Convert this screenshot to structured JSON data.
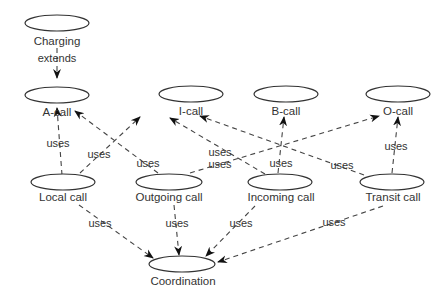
{
  "diagram": {
    "type": "use-case diagram",
    "nodes": [
      {
        "id": "charging",
        "label": "Charging"
      },
      {
        "id": "a_call",
        "label": "A-call"
      },
      {
        "id": "i_call",
        "label": "I-call"
      },
      {
        "id": "b_call",
        "label": "B-call"
      },
      {
        "id": "o_call",
        "label": "O-call"
      },
      {
        "id": "local_call",
        "label": "Local call"
      },
      {
        "id": "outgoing_call",
        "label": "Outgoing call"
      },
      {
        "id": "incoming_call",
        "label": "Incoming call"
      },
      {
        "id": "transit_call",
        "label": "Transit call"
      },
      {
        "id": "coordination",
        "label": "Coordination"
      }
    ],
    "edges": [
      {
        "from": "charging",
        "to": "a_call",
        "label": "extends"
      },
      {
        "from": "local_call",
        "to": "a_call",
        "label": "uses"
      },
      {
        "from": "local_call",
        "to": "i_call",
        "label": "uses"
      },
      {
        "from": "outgoing_call",
        "to": "a_call",
        "label": "uses"
      },
      {
        "from": "outgoing_call",
        "to": "o_call",
        "label": "uses"
      },
      {
        "from": "incoming_call",
        "to": "i_call",
        "label": "uses"
      },
      {
        "from": "incoming_call",
        "to": "b_call",
        "label": "uses"
      },
      {
        "from": "transit_call",
        "to": "i_call",
        "label": "uses"
      },
      {
        "from": "transit_call",
        "to": "o_call",
        "label": "uses"
      },
      {
        "from": "local_call",
        "to": "coordination",
        "label": "uses"
      },
      {
        "from": "outgoing_call",
        "to": "coordination",
        "label": "uses"
      },
      {
        "from": "incoming_call",
        "to": "coordination",
        "label": "uses"
      },
      {
        "from": "transit_call",
        "to": "coordination",
        "label": "uses"
      }
    ]
  }
}
